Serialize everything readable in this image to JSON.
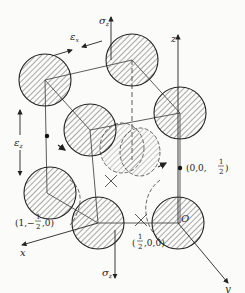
{
  "figure": {
    "axes": {
      "x": "x",
      "y": "y",
      "z": "z",
      "origin": "O"
    },
    "stress_top": {
      "symbol": "σ",
      "subscript": "z"
    },
    "stress_bottom": {
      "symbol": "σ",
      "subscript": "z"
    },
    "strain_x": {
      "symbol": "ε",
      "subscript": "x"
    },
    "strain_z": {
      "symbol": "ε",
      "subscript": "z"
    },
    "points": [
      {
        "name": "point-0-0-half",
        "open": "(0,0,",
        "num": "1",
        "den": "2",
        "close": ")"
      },
      {
        "name": "point-1-neghalf-0",
        "open": "(1,−",
        "num": "1",
        "den": "2",
        "close": ",0)"
      },
      {
        "name": "point-half-0-0",
        "open": "(",
        "num": "1",
        "den": "2",
        "close": ",0,0)"
      }
    ],
    "colors": {
      "stroke": "#333333",
      "hatch": "#555555",
      "background": "#fbfbfa"
    }
  }
}
